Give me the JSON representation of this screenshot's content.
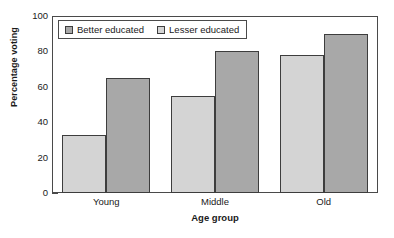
{
  "chart_data": {
    "type": "bar",
    "title": "",
    "xlabel": "Age group",
    "ylabel": "Percentage voting",
    "categories": [
      "Young",
      "Middle",
      "Old"
    ],
    "series": [
      {
        "name": "Better educated",
        "values": [
          65,
          80,
          90
        ],
        "color": "#a8a8a8"
      },
      {
        "name": "Lesser educated",
        "values": [
          33,
          55,
          78
        ],
        "color": "#d4d4d4"
      }
    ],
    "draw_order": [
      "Lesser educated",
      "Better educated"
    ],
    "ylim": [
      0,
      100
    ],
    "yticks": [
      0,
      20,
      40,
      60,
      80,
      100
    ],
    "ytick_labels": [
      "0",
      "20",
      "40",
      "60",
      "80",
      "100"
    ],
    "grid": false,
    "legend_position": "top-left-inside",
    "bar_edge_color": "#3d3d3d",
    "axis_color": "#4a4a4a"
  },
  "legend": {
    "entries": [
      {
        "label": "Better educated",
        "color": "#a8a8a8"
      },
      {
        "label": "Lesser educated",
        "color": "#d4d4d4"
      }
    ]
  }
}
